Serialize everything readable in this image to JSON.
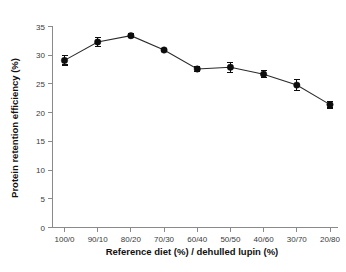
{
  "chart_data": {
    "type": "line",
    "title": "",
    "xlabel": "Reference diet (%) / dehulled lupin (%)",
    "ylabel": "Protein retention efficiency (%)",
    "categories": [
      "100/0",
      "90/10",
      "80/20",
      "70/30",
      "60/40",
      "50/50",
      "40/60",
      "30/70",
      "20/80"
    ],
    "values": [
      29.1,
      32.3,
      33.4,
      30.9,
      27.6,
      27.9,
      26.7,
      24.8,
      21.4
    ],
    "errors": [
      0.8,
      0.8,
      0.3,
      0.2,
      0.5,
      0.9,
      0.6,
      0.9,
      0.6
    ],
    "series": [
      {
        "name": "Protein retention efficiency",
        "values": [
          29.1,
          32.3,
          33.4,
          30.9,
          27.6,
          27.9,
          26.7,
          24.8,
          21.4
        ],
        "errors": [
          0.8,
          0.8,
          0.3,
          0.2,
          0.5,
          0.9,
          0.6,
          0.9,
          0.6
        ]
      }
    ],
    "ylim": [
      0,
      35
    ],
    "yticks": [
      0,
      5,
      10,
      15,
      20,
      25,
      30,
      35
    ],
    "ytick_labels": [
      "0",
      "5",
      "10",
      "15",
      "20",
      "25",
      "30",
      "35"
    ],
    "grid": false,
    "legend": "none",
    "marker": "filled-circle",
    "line_color": "#2b2b2b",
    "marker_color": "#0d0d0d",
    "axis_color": "#8a8a8a",
    "background": "#ffffff"
  }
}
